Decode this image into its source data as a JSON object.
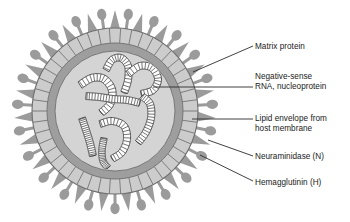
{
  "figure": {
    "type": "labeled-biological-diagram",
    "background_color": "#ffffff"
  },
  "virion": {
    "center_x": 115,
    "center_y": 111,
    "layers": [
      {
        "name": "spike-layer",
        "semantic": "surface glycoprotein spikes",
        "outer_radius": 104,
        "color": "#9b9b9b"
      },
      {
        "name": "matrix-protein-layer",
        "semantic": "matrix protein shell with radial subunit segments",
        "outer_radius": 83,
        "inner_radius": 68,
        "color": "#cccccc",
        "segment_count": 46,
        "segment_stroke": "#6e6e6e"
      },
      {
        "name": "lipid-envelope-layer",
        "semantic": "lipid envelope from host membrane",
        "outer_radius": 68,
        "inner_radius": 60,
        "color": "#9e9e9e"
      },
      {
        "name": "interior-core",
        "semantic": "nucleocapsid interior containing RNA segments",
        "outer_radius": 60,
        "color": "#d4d4d4"
      }
    ],
    "spikes": {
      "total_count": 46,
      "alternating": true,
      "hemagglutinin": {
        "shape": "triangular cone",
        "count": 23,
        "color": "#9b9b9b",
        "length": 21
      },
      "neuraminidase": {
        "shape": "mushroom knob on thin stalk",
        "count": 23,
        "color": "#9b9b9b",
        "stalk_length": 15,
        "knob_radius": 4.6
      }
    },
    "rna_segments": {
      "semantic": "negative-sense RNA coiled with nucleoprotein",
      "count": 8,
      "style": "striated helical tube",
      "fill": "#ffffff",
      "stroke": "#3a3a3a"
    }
  },
  "labels": [
    {
      "id": "matrix-protein",
      "text": "Matrix protein",
      "lines": [
        "Matrix protein"
      ],
      "leader_from_x": 253,
      "leader_from_y": 46,
      "leader_to_x": 193,
      "leader_to_y": 72
    },
    {
      "id": "rna-nucleoprotein",
      "text": "Negative-sense RNA, nucleoprotein",
      "lines": [
        "Negative-sense",
        "RNA, nucleoprotein"
      ],
      "leader_from_x": 253,
      "leader_from_y": 87,
      "leader_to_x": 153,
      "leader_to_y": 87
    },
    {
      "id": "lipid-envelope",
      "text": "Lipid envelope from host membrane",
      "lines": [
        "Lipid envelope from",
        "host membrane"
      ],
      "leader_from_x": 253,
      "leader_from_y": 119,
      "leader_to_x": 192,
      "leader_to_y": 119
    },
    {
      "id": "neuraminidase",
      "text": "Neuraminidase (N)",
      "lines": [
        "Neuraminidase (N)"
      ],
      "leader_from_x": 253,
      "leader_from_y": 156,
      "leader_to_x": 208,
      "leader_to_y": 140
    },
    {
      "id": "hemagglutinin",
      "text": "Hemagglutinin (H)",
      "lines": [
        "Hemagglutinin (H)"
      ],
      "leader_from_x": 253,
      "leader_from_y": 181,
      "leader_to_x": 200,
      "leader_to_y": 155
    }
  ],
  "label_text": {
    "matrix_protein": "Matrix protein",
    "rna_line1": "Negative-sense",
    "rna_line2": "RNA, nucleoprotein",
    "lipid_line1": "Lipid envelope from",
    "lipid_line2": "host membrane",
    "neuraminidase": "Neuraminidase (N)",
    "hemagglutinin": "Hemagglutinin (H)"
  },
  "colors": {
    "spike": "#9b9b9b",
    "matrix_ring": "#cccccc",
    "matrix_stroke": "#6e6e6e",
    "lipid_ring": "#9e9e9e",
    "interior": "#d4d4d4",
    "rna_stroke": "#3a3a3a",
    "leader_line": "#2b2b2b",
    "text": "#1a1a1a",
    "background": "#ffffff"
  }
}
